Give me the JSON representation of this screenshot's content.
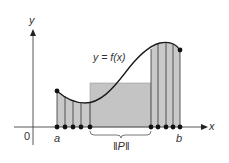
{
  "figure": {
    "type": "riemann-sum-partition-diagram",
    "labels": {
      "y_axis": "y",
      "x_axis": "x",
      "origin": "0",
      "a": "a",
      "b": "b",
      "function": "y = f(x)",
      "norm": "‖P‖"
    },
    "colors": {
      "fill": "#c9c9c9",
      "fill_dark": "#bdbdbd",
      "stroke": "#222222",
      "axis": "#333333",
      "point": "#111111"
    },
    "partition_points_x": [
      57,
      65,
      73,
      81,
      90,
      151,
      158,
      166,
      173,
      180
    ]
  }
}
